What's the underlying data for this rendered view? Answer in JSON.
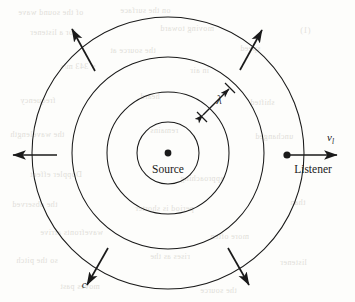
{
  "figure": {
    "center_label": "Source",
    "listener_label": "Listener",
    "velocity_label": "v",
    "velocity_subscript": "l",
    "wavelength_label": "λ",
    "speed_label": "c",
    "colors": {
      "ink": "#1a1a1a",
      "paper": "#fdfdfb",
      "bleed_text": "#c9c6bd"
    },
    "geometry": {
      "center_x": 168,
      "center_y": 153,
      "radii": [
        31,
        61,
        96,
        136
      ],
      "listener_x": 287,
      "listener_y": 155,
      "velocity_arrow_end_x": 338
    },
    "arrows": [
      {
        "name": "wavefront-arrow-upper-left",
        "angle_deg": 135
      },
      {
        "name": "wavefront-arrow-upper-right",
        "angle_deg": 45
      },
      {
        "name": "wavefront-arrow-left",
        "angle_deg": 180
      },
      {
        "name": "wavefront-arrow-lower-left",
        "angle_deg": 225
      },
      {
        "name": "wavefront-arrow-lower-right",
        "angle_deg": 315
      }
    ]
  },
  "bleed_text": [
    {
      "text": "of the sound wave",
      "x": 18,
      "y": 8
    },
    {
      "text": "on the surface",
      "x": 120,
      "y": 6
    },
    {
      "text": "for a listener",
      "x": 30,
      "y": 28
    },
    {
      "text": "moving toward",
      "x": 160,
      "y": 24
    },
    {
      "text": "(1)",
      "x": 300,
      "y": 26
    },
    {
      "text": "the source at",
      "x": 110,
      "y": 46
    },
    {
      "text": "speed",
      "x": 240,
      "y": 44
    },
    {
      "text": "= 343 m/s",
      "x": 60,
      "y": 62
    },
    {
      "text": "in air",
      "x": 190,
      "y": 66
    },
    {
      "text": "frequency",
      "x": 20,
      "y": 96
    },
    {
      "text": "heard",
      "x": 140,
      "y": 92
    },
    {
      "text": "shifted",
      "x": 250,
      "y": 98
    },
    {
      "text": "the wavelength",
      "x": 10,
      "y": 130
    },
    {
      "text": "remains",
      "x": 150,
      "y": 126
    },
    {
      "text": "unchanged",
      "x": 255,
      "y": 132
    },
    {
      "text": "Doppler effect",
      "x": 30,
      "y": 170
    },
    {
      "text": "approaching",
      "x": 180,
      "y": 174
    },
    {
      "text": "the observed",
      "x": 12,
      "y": 200
    },
    {
      "text": "period is shorter",
      "x": 135,
      "y": 204
    },
    {
      "text": "than",
      "x": 290,
      "y": 198
    },
    {
      "text": "wavefronts arrive",
      "x": 40,
      "y": 228
    },
    {
      "text": "more often",
      "x": 210,
      "y": 232
    },
    {
      "text": "so the pitch",
      "x": 16,
      "y": 256
    },
    {
      "text": "rises as the",
      "x": 150,
      "y": 252
    },
    {
      "text": "listener",
      "x": 280,
      "y": 258
    },
    {
      "text": "moves past",
      "x": 60,
      "y": 282
    },
    {
      "text": "the source",
      "x": 200,
      "y": 286
    }
  ]
}
